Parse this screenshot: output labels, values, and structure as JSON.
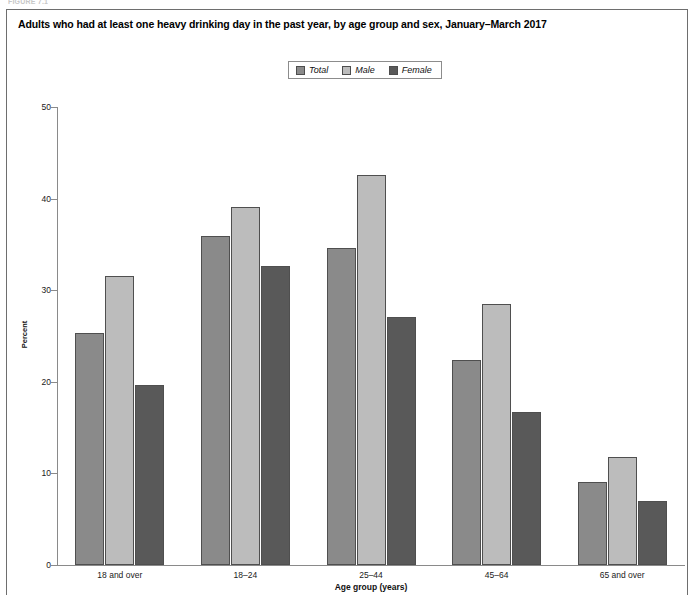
{
  "figure": {
    "label": "FIGURE 7.1"
  },
  "title": "Adults who had at least one heavy drinking day in the past year, by age group and sex, January–March 2017",
  "legend": {
    "position": "top-center",
    "items": [
      {
        "label": "Total",
        "color": "#8a8a8a"
      },
      {
        "label": "Male",
        "color": "#bcbcbc"
      },
      {
        "label": "Female",
        "color": "#595959"
      }
    ]
  },
  "axes": {
    "y_title": "Percent",
    "x_title": "Age group (years)",
    "y_ticks": [
      "0",
      "10",
      "20",
      "30",
      "40",
      "50"
    ]
  },
  "chart_data": {
    "type": "bar",
    "title": "Adults who had at least one heavy drinking day in the past year, by age group and sex, January–March 2017",
    "xlabel": "Age group (years)",
    "ylabel": "Percent",
    "ylim": [
      0,
      50
    ],
    "yticks": [
      0,
      10,
      20,
      30,
      40,
      50
    ],
    "grid": false,
    "legend_position": "top-center",
    "categories": [
      "18 and over",
      "18–24",
      "25–44",
      "45–64",
      "65 and over"
    ],
    "series": [
      {
        "name": "Total",
        "color": "#8a8a8a",
        "values": [
          25.3,
          35.9,
          34.6,
          22.4,
          9.1
        ]
      },
      {
        "name": "Male",
        "color": "#bcbcbc",
        "values": [
          31.5,
          39.1,
          42.6,
          28.5,
          11.8
        ]
      },
      {
        "name": "Female",
        "color": "#595959",
        "values": [
          19.7,
          32.6,
          27.1,
          16.7,
          7.0
        ]
      }
    ]
  }
}
